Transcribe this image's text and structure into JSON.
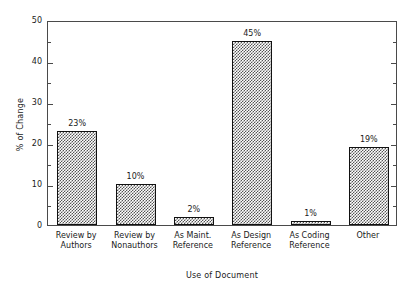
{
  "chart_data": {
    "type": "bar",
    "title": "",
    "xlabel": "Use of Document",
    "ylabel": "% of Change",
    "categories": [
      "Review by Authors",
      "Review by Nonauthors",
      "As Maint. Reference",
      "As Design Reference",
      "As Coding Reference",
      "Other"
    ],
    "category_lines": [
      [
        "Review by",
        "Authors"
      ],
      [
        "Review by",
        "Nonauthors"
      ],
      [
        "As Maint.",
        "Reference"
      ],
      [
        "As Design",
        "Reference"
      ],
      [
        "As Coding",
        "Reference"
      ],
      [
        "Other",
        ""
      ]
    ],
    "values": [
      23,
      10,
      2,
      45,
      1,
      19
    ],
    "value_labels": [
      "23%",
      "10%",
      "2%",
      "45%",
      "1%",
      "19%"
    ],
    "ylim": [
      0,
      50
    ],
    "yticks": [
      0,
      10,
      20,
      30,
      40,
      50
    ],
    "ytick_labels": [
      "0",
      "10",
      "20",
      "30",
      "40",
      "50"
    ],
    "yticks_minor": [
      5,
      15,
      25,
      35,
      45
    ],
    "grid": false,
    "legend": null,
    "bar_fill": "checkerboard",
    "bar_edge_color": "#111111",
    "frame_color": "#4a4a4a",
    "text_color": "#1a1a1a",
    "background": "#ffffff"
  }
}
